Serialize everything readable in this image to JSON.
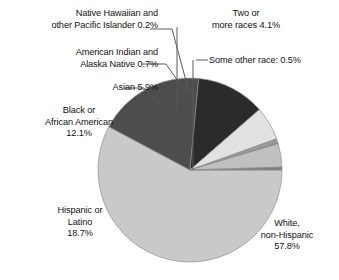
{
  "chart_data": {
    "type": "pie",
    "title": "",
    "subtitle": "",
    "xlabel": "",
    "ylabel": "",
    "legend_position": "none",
    "grid": false,
    "units": "percent",
    "total": 100.0,
    "categories": [
      "White, non-Hispanic",
      "Hispanic or Latino",
      "Black or African American",
      "Asian",
      "American Indian and Alaska Native",
      "Native Hawaiian and other Pacific Islander",
      "Two or more races",
      "Some other race"
    ],
    "values": [
      57.8,
      18.7,
      12.1,
      5.9,
      0.7,
      0.2,
      4.1,
      0.5
    ],
    "slices": [
      {
        "name": "White, non-Hispanic",
        "value": 57.8,
        "value_text": "57.8%",
        "color": "#c9c9c9",
        "start_deg": 0,
        "end_deg": 208.08
      },
      {
        "name": "Hispanic or Latino",
        "value": 18.7,
        "value_text": "18.7%",
        "color": "#4d4d4d",
        "start_deg": 208.08,
        "end_deg": 275.4
      },
      {
        "name": "Black or African American",
        "value": 12.1,
        "value_text": "12.1%",
        "color": "#2b2b2b",
        "start_deg": 275.4,
        "end_deg": 318.96
      },
      {
        "name": "Asian",
        "value": 5.9,
        "value_text": "5.9%",
        "color": "#e2e2e2",
        "start_deg": 318.96,
        "end_deg": 340.2
      },
      {
        "name": "American Indian and Alaska Native",
        "value": 0.7,
        "value_text": "0.7%",
        "color": "#9a9a9a",
        "start_deg": 340.2,
        "end_deg": 342.72
      },
      {
        "name": "Native Hawaiian and other Pacific Islander",
        "value": 0.2,
        "value_text": "0.2%",
        "color": "#6e6e6e",
        "start_deg": 342.72,
        "end_deg": 343.44
      },
      {
        "name": "Two or more races",
        "value": 4.1,
        "value_text": "4.1%",
        "color": "#c0c0c0",
        "start_deg": 343.44,
        "end_deg": 358.2
      },
      {
        "name": "Some other race",
        "value": 0.5,
        "value_text": "0.5%",
        "color": "#7d7d7d",
        "start_deg": 358.2,
        "end_deg": 360
      }
    ]
  },
  "labels": {
    "nhpi": "Native Hawaiian and\nother Pacific Islander 0.2%",
    "aian": "American Indian and\nAlaska Native 0.7%",
    "asian": "Asian 5.9%",
    "black": "Black or\nAfrican American\n12.1%",
    "hispanic": "Hispanic or\nLatino\n18.7%",
    "white": "White,\nnon-Hispanic\n57.8%",
    "two_or_more": "Two or\nmore races 4.1%",
    "some_other": "Some other race: 0.5%"
  },
  "style": {
    "background": "#ffffff",
    "text_color": "#111111",
    "leader_line_color": "#5a5a5a",
    "slice_edge_color": "#8f8f8f"
  }
}
